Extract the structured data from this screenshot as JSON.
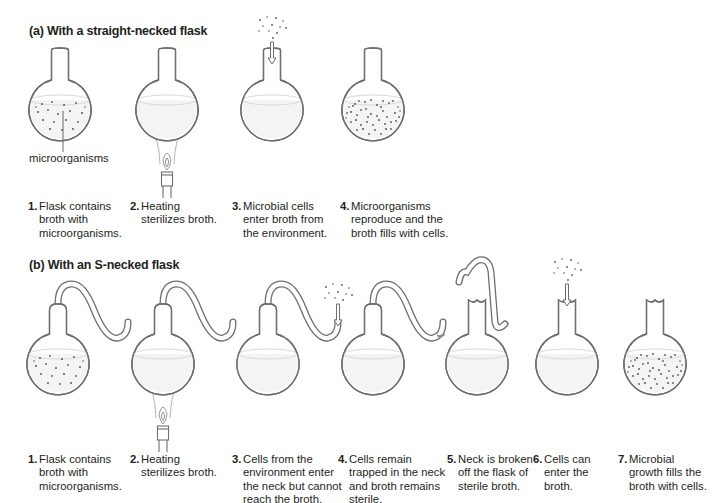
{
  "panel_a": {
    "tag": "(a)",
    "title": "With a straight-necked flask",
    "callout": "microorganisms",
    "steps": [
      {
        "num": "1.",
        "text": "Flask contains\nbroth with\nmicroorganisms."
      },
      {
        "num": "2.",
        "text": "Heating\nsterilizes broth."
      },
      {
        "num": "3.",
        "text": "Microbial cells\nenter broth from\nthe environment."
      },
      {
        "num": "4.",
        "text": "Microorganisms\nreproduce and the\nbroth fills with cells."
      }
    ]
  },
  "panel_b": {
    "tag": "(b)",
    "title": "With an S-necked flask",
    "steps": [
      {
        "num": "1.",
        "text": "Flask contains\nbroth with\nmicroorganisms."
      },
      {
        "num": "2.",
        "text": "Heating\nsterilizes broth."
      },
      {
        "num": "3.",
        "text": "Cells from the\nenvironment enter\nthe neck but cannot\nreach the broth."
      },
      {
        "num": "4.",
        "text": "Cells remain\ntrapped in the neck\nand broth remains\nsterile."
      },
      {
        "num": "5.",
        "text": "Neck is broken\noff the flask of\nsterile broth."
      },
      {
        "num": "6.",
        "text": "Cells can\nenter the\nbroth."
      },
      {
        "num": "7.",
        "text": "Microbial\ngrowth fills the\nbroth with cells."
      }
    ]
  }
}
